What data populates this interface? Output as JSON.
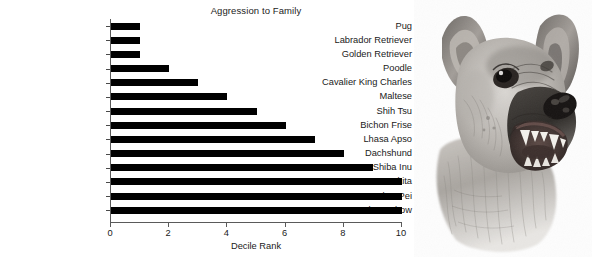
{
  "chart_data": {
    "type": "bar",
    "orientation": "horizontal",
    "title": "Aggression to Family",
    "xlabel": "Decile Rank",
    "ylabel": "",
    "xlim": [
      0,
      10
    ],
    "xticks": [
      0,
      2,
      4,
      6,
      8,
      10
    ],
    "grid": false,
    "legend": null,
    "bar_color": "#000000",
    "categories": [
      "Pug",
      "Labrador Retriever",
      "Golden Retriever",
      "Poodle",
      "Cavalier King Charles",
      "Maltese",
      "Shih Tsu",
      "Bichon Frise",
      "Lhasa Apso",
      "Dachshund",
      "Shiba Inu",
      "Akita",
      "Shar Pei",
      "Chow Chow"
    ],
    "values": [
      1,
      1,
      1,
      2,
      3,
      4,
      5,
      6,
      7,
      8,
      9,
      10,
      10,
      10
    ]
  },
  "photo": {
    "name": "snarling-german-shepherd-sketch",
    "description": "Pencil sketch of a snarling dog head with bared teeth"
  }
}
